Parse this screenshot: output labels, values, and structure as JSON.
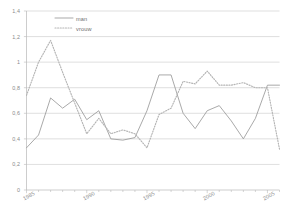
{
  "chart_data": {
    "type": "line",
    "title": "",
    "subtitle": "",
    "xlabel": "",
    "ylabel": "",
    "xlim": [
      1985,
      2006
    ],
    "ylim": [
      0,
      1.4
    ],
    "grid": true,
    "legend_position": "top-left",
    "y_ticks": [
      0,
      0.2,
      0.4,
      0.6,
      0.8,
      1,
      1.2,
      1.4
    ],
    "y_tick_labels": [
      "0",
      "0,2",
      "0,4",
      "0,6",
      "0,8",
      "1",
      "1,2",
      "1,4"
    ],
    "x_ticks": [
      1985,
      1990,
      1995,
      2000,
      2005
    ],
    "x_tick_labels": [
      "1985",
      "1990",
      "1995",
      "2000",
      "2005"
    ],
    "x": [
      1985,
      1986,
      1987,
      1988,
      1989,
      1990,
      1991,
      1992,
      1993,
      1994,
      1995,
      1996,
      1997,
      1998,
      1999,
      2000,
      2001,
      2002,
      2003,
      2004,
      2005,
      2006
    ],
    "series": [
      {
        "name": "man",
        "style": "solid",
        "color": "#9a9a9a",
        "values": [
          0.33,
          0.43,
          0.72,
          0.64,
          0.71,
          0.55,
          0.62,
          0.4,
          0.39,
          0.41,
          0.62,
          0.9,
          0.9,
          0.6,
          0.48,
          0.62,
          0.66,
          0.54,
          0.4,
          0.56,
          0.82,
          0.82
        ]
      },
      {
        "name": "vrouw",
        "style": "dotted",
        "color": "#b4b4b4",
        "values": [
          0.74,
          1.0,
          1.17,
          0.92,
          0.68,
          0.44,
          0.56,
          0.44,
          0.47,
          0.44,
          0.33,
          0.59,
          0.64,
          0.85,
          0.83,
          0.93,
          0.82,
          0.82,
          0.84,
          0.8,
          0.8,
          0.32
        ]
      }
    ]
  },
  "legend": {
    "items": [
      {
        "label": "man",
        "style": "solid"
      },
      {
        "label": "vrouw",
        "style": "dotted"
      }
    ]
  },
  "axes": {
    "y_axis_color": "#b8b8b8",
    "x_axis_color": "#b8b8b8",
    "grid_color": "#c9c9c9"
  }
}
